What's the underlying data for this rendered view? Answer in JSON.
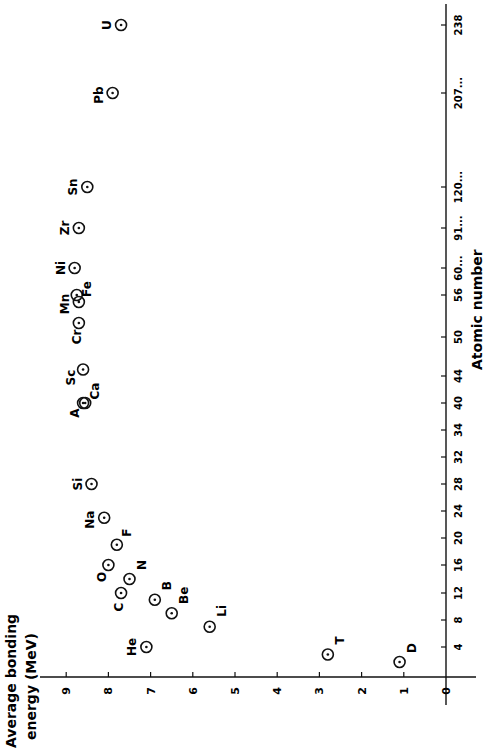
{
  "chart_data": {
    "type": "scatter",
    "title": "",
    "orientation_note": "figure printed rotated 90 degrees counter-clockwise",
    "xlabel": "Atomic number",
    "ylabel": "Average bonding energy (MeV)",
    "x_ticks": [
      "0",
      "4",
      "8",
      "12",
      "16",
      "20",
      "24",
      "28",
      "32",
      "34",
      "40",
      "44",
      "50",
      "56",
      "60...",
      "91...",
      "120...",
      "207...",
      "238"
    ],
    "y_ticks": [
      "0",
      "1",
      "2",
      "3",
      "4",
      "5",
      "6",
      "7",
      "8",
      "9"
    ],
    "ylim": [
      0,
      9.5
    ],
    "grid": false,
    "legend": null,
    "points": [
      {
        "label": "D",
        "x": 2,
        "y": 1.1
      },
      {
        "label": "T",
        "x": 3,
        "y": 2.8
      },
      {
        "label": "He",
        "x": 4,
        "y": 7.1
      },
      {
        "label": "Li",
        "x": 7,
        "y": 5.6
      },
      {
        "label": "Be",
        "x": 9,
        "y": 6.5
      },
      {
        "label": "B",
        "x": 11,
        "y": 6.9
      },
      {
        "label": "C",
        "x": 12,
        "y": 7.7
      },
      {
        "label": "N",
        "x": 14,
        "y": 7.5
      },
      {
        "label": "O",
        "x": 16,
        "y": 8.0
      },
      {
        "label": "F",
        "x": 19,
        "y": 7.8
      },
      {
        "label": "Na",
        "x": 23,
        "y": 8.1
      },
      {
        "label": "Si",
        "x": 28,
        "y": 8.4
      },
      {
        "label": "A",
        "x": 40,
        "y": 8.6
      },
      {
        "label": "Ca",
        "x": 40,
        "y": 8.55
      },
      {
        "label": "Sc",
        "x": 45,
        "y": 8.6
      },
      {
        "label": "Cr",
        "x": 52,
        "y": 8.7
      },
      {
        "label": "Mn",
        "x": 55,
        "y": 8.7
      },
      {
        "label": "Fe",
        "x": 56,
        "y": 8.75
      },
      {
        "label": "Ni",
        "x": 60,
        "y": 8.8
      },
      {
        "label": "Zr",
        "x": 91,
        "y": 8.7
      },
      {
        "label": "Sn",
        "x": 120,
        "y": 8.5
      },
      {
        "label": "Pb",
        "x": 207,
        "y": 7.9
      },
      {
        "label": "U",
        "x": 238,
        "y": 7.7
      }
    ]
  },
  "labels": {
    "ylabel_line1": "Average bonding",
    "ylabel_line2": "energy (MeV)",
    "xlabel": "Atomic number"
  },
  "style": {
    "ink": "#111111",
    "paper": "#ffffff"
  }
}
